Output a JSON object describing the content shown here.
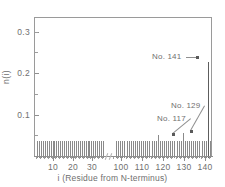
{
  "chart_data": {
    "type": "bar",
    "title": "",
    "subtitle": "",
    "xlabel": "i (Residue from N-terminus)",
    "ylabel": "n(i)",
    "grid": false,
    "legend": null,
    "ylim": [
      0,
      0.335
    ],
    "yticks": [
      0.1,
      0.2,
      0.3
    ],
    "ytick_labels": [
      "0.1",
      "0.2",
      "0.3"
    ],
    "y_minor_ticks": [
      0.05,
      0.15,
      0.25,
      0.3
    ],
    "x_axis_broken": true,
    "xlim_segments": [
      [
        1,
        36
      ],
      [
        96,
        143
      ]
    ],
    "xticks": [
      10,
      20,
      30,
      100,
      110,
      120,
      130,
      140
    ],
    "xtick_labels": [
      "10",
      "20",
      "30",
      "100",
      "110",
      "120",
      "130",
      "140"
    ],
    "baseline_value": 0.0,
    "background_level": 0.042,
    "segment_1_range": [
      1,
      35
    ],
    "segment_2_range": [
      97,
      142
    ],
    "series": [
      {
        "name": "n(i)",
        "color": "#8a8a8a",
        "x": [
          1,
          2,
          3,
          4,
          5,
          6,
          7,
          8,
          9,
          10,
          11,
          12,
          13,
          14,
          15,
          16,
          17,
          18,
          19,
          20,
          21,
          22,
          23,
          24,
          25,
          26,
          27,
          28,
          29,
          30,
          31,
          32,
          33,
          34,
          35,
          97,
          98,
          99,
          100,
          101,
          102,
          103,
          104,
          105,
          106,
          107,
          108,
          109,
          110,
          111,
          112,
          113,
          114,
          115,
          116,
          117,
          118,
          119,
          120,
          121,
          122,
          123,
          124,
          125,
          126,
          127,
          128,
          129,
          130,
          131,
          132,
          133,
          134,
          135,
          136,
          137,
          138,
          139,
          140,
          141,
          142
        ],
        "values": [
          0.042,
          0.042,
          0.042,
          0.042,
          0.042,
          0.042,
          0.042,
          0.042,
          0.042,
          0.042,
          0.042,
          0.042,
          0.042,
          0.042,
          0.042,
          0.042,
          0.042,
          0.042,
          0.042,
          0.042,
          0.042,
          0.042,
          0.042,
          0.042,
          0.042,
          0.042,
          0.042,
          0.042,
          0.042,
          0.042,
          0.042,
          0.042,
          0.042,
          0.042,
          0.042,
          0.042,
          0.042,
          0.042,
          0.042,
          0.042,
          0.042,
          0.042,
          0.042,
          0.042,
          0.042,
          0.042,
          0.042,
          0.042,
          0.042,
          0.042,
          0.042,
          0.042,
          0.042,
          0.042,
          0.042,
          0.055,
          0.042,
          0.042,
          0.042,
          0.042,
          0.042,
          0.042,
          0.042,
          0.042,
          0.042,
          0.042,
          0.042,
          0.06,
          0.042,
          0.042,
          0.042,
          0.042,
          0.042,
          0.042,
          0.042,
          0.042,
          0.042,
          0.042,
          0.042,
          0.232,
          0.042
        ]
      }
    ],
    "annotations": [
      {
        "label": "No. 117",
        "residue": 117,
        "value": 0.055,
        "text_x": 157,
        "text_y": 114,
        "tip_x": 173,
        "tip_y": 134
      },
      {
        "label": "No. 129",
        "residue": 129,
        "value": 0.06,
        "text_x": 171,
        "text_y": 101,
        "tip_x": 191,
        "tip_y": 131
      },
      {
        "label": "No. 141",
        "residue": 141,
        "value": 0.232,
        "text_x": 152,
        "text_y": 52,
        "tip_x": 197,
        "tip_y": 57
      }
    ]
  }
}
